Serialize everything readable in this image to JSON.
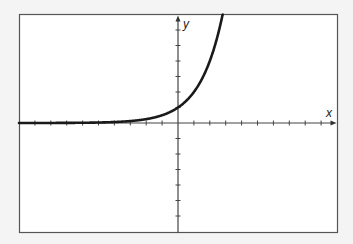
{
  "chart_data": {
    "type": "line",
    "title": "",
    "function": "y = 2^x",
    "xlabel": "x",
    "ylabel": "y",
    "xlim": [
      -10,
      10
    ],
    "ylim": [
      -7,
      7
    ],
    "x_tick_step": 1,
    "y_tick_step": 1,
    "grid": false,
    "tick_labels": false,
    "series": [
      {
        "name": "y = 2^x",
        "x": [
          -10,
          -8,
          -6,
          -4,
          -3,
          -2,
          -1,
          0,
          0.5,
          1,
          1.5,
          2,
          2.5,
          2.81
        ],
        "y": [
          0.001,
          0.004,
          0.016,
          0.0625,
          0.125,
          0.25,
          0.5,
          1,
          1.414,
          2,
          2.828,
          4,
          5.657,
          7
        ]
      }
    ]
  },
  "colors": {
    "background": "#f4f4f4",
    "plot_background": "#ffffff",
    "frame": "#555555",
    "axis": "#444444",
    "curve": "#1a1a1a"
  },
  "labels": {
    "x_axis": "x",
    "y_axis": "y"
  }
}
